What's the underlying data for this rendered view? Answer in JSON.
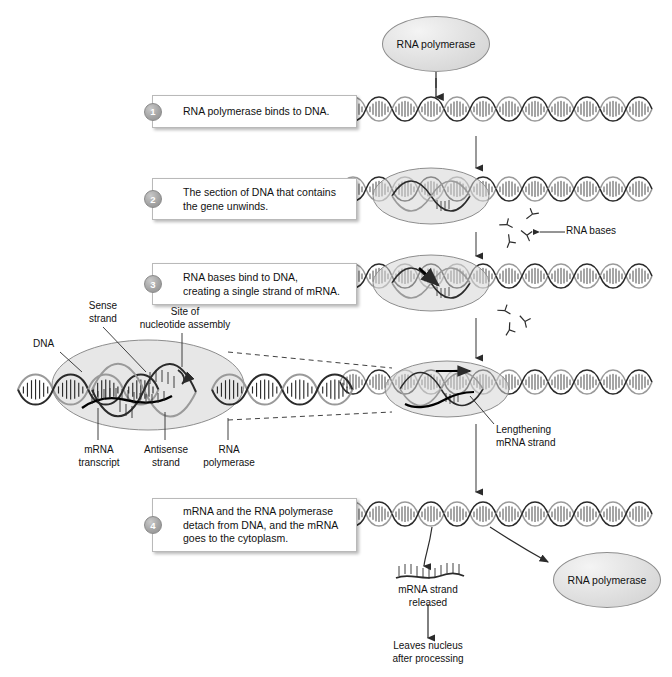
{
  "diagram": {
    "colors": {
      "ink": "#1a1a1a",
      "oval_fill": "#e3e3e3",
      "oval_stroke": "#8d8d8d",
      "box_border": "#b9b9b9",
      "step_badge": "#a5a5a5",
      "dna_stroke": "#2b2b2b",
      "background": "#ffffff"
    }
  },
  "top": {
    "polymerase_label": "RNA\npolymerase"
  },
  "steps": [
    {
      "number": "1",
      "text": "RNA polymerase binds to DNA."
    },
    {
      "number": "2",
      "text": "The section of DNA that contains\nthe gene unwinds."
    },
    {
      "number": "3",
      "text": "RNA bases bind to DNA,\ncreating a single strand of mRNA."
    },
    {
      "number": "4",
      "text": "mRNA and the RNA polymerase\ndetach from DNA, and the mRNA\ngoes to the cytoplasm."
    }
  ],
  "annotations": {
    "rna_bases": "RNA bases",
    "lengthening": "Lengthening\nmRNA strand",
    "mrna_released": "mRNA strand\nreleased",
    "leaves_nucleus": "Leaves nucleus\nafter processing",
    "polymerase_released": "RNA\npolymerase"
  },
  "inset": {
    "sense_strand": "Sense\nstrand",
    "site_of_assembly": "Site of\nnucleotide assembly",
    "dna": "DNA",
    "mrna_transcript": "mRNA\ntranscript",
    "antisense_strand": "Antisense\nstrand",
    "rna_polymerase": "RNA\npolymerase"
  }
}
